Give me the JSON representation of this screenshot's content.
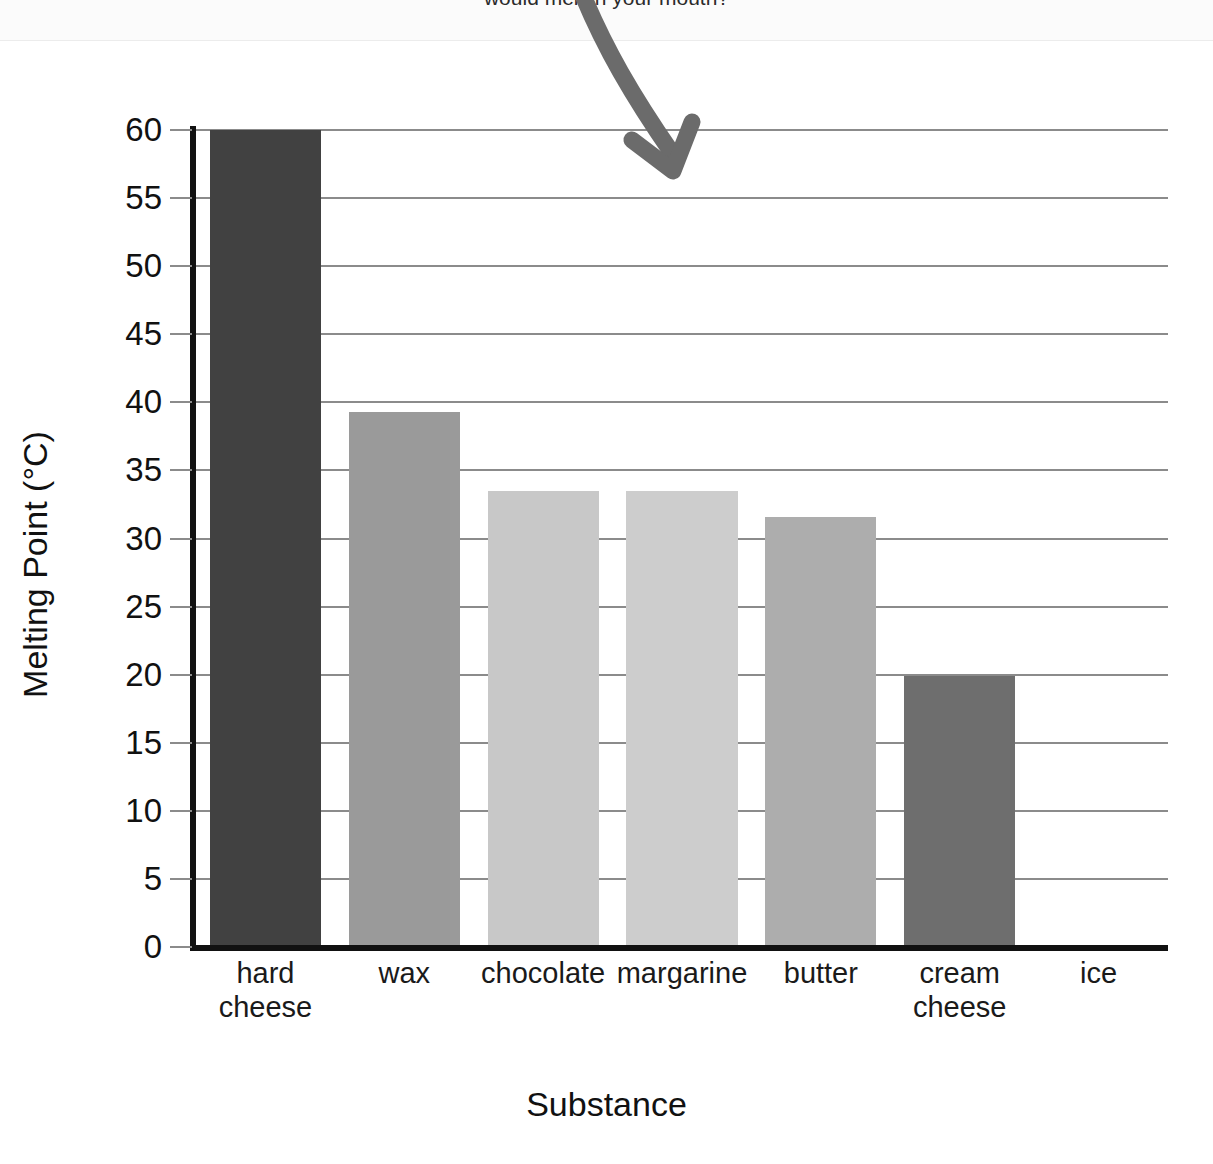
{
  "header": {
    "clipped_text": "would melt in your mouth?"
  },
  "axes": {
    "y_title": "Melting Point (°C)",
    "x_title": "Substance"
  },
  "annotation": {
    "arrow_name": "curved-down-arrow",
    "color": "#6b6b6b"
  },
  "colors": {
    "bar_hard_cheese": "#414141",
    "bar_wax": "#9a9a9a",
    "bar_chocolate": "#c8c8c8",
    "bar_margarine": "#cdcdcd",
    "bar_butter": "#adadad",
    "bar_cream_cheese": "#6e6e6e",
    "bar_ice": "#cdcdcd",
    "gridline": "#8b8b8b",
    "axis": "#111111",
    "text": "#111111"
  },
  "chart_data": {
    "type": "bar",
    "title": "",
    "xlabel": "Substance",
    "ylabel": "Melting Point (°C)",
    "ylim": [
      0,
      60
    ],
    "ytick_step": 5,
    "yticks": [
      0,
      5,
      10,
      15,
      20,
      25,
      30,
      35,
      40,
      45,
      50,
      55,
      60
    ],
    "ytick_labels": [
      "0",
      "5",
      "10",
      "15",
      "20",
      "25",
      "30",
      "35",
      "40",
      "45",
      "50",
      "55",
      "60"
    ],
    "grid": true,
    "grid_axis": "y",
    "legend": false,
    "categories": [
      "hard cheese",
      "wax",
      "chocolate",
      "margarine",
      "butter",
      "cream cheese",
      "ice"
    ],
    "category_lines": [
      [
        "hard",
        "cheese"
      ],
      [
        "wax"
      ],
      [
        "chocolate"
      ],
      [
        "margarine"
      ],
      [
        "butter"
      ],
      [
        "cream",
        "cheese"
      ],
      [
        "ice"
      ]
    ],
    "values": [
      60,
      39.3,
      33.5,
      33.5,
      31.6,
      19.9,
      0
    ],
    "bar_colors": [
      "#414141",
      "#9a9a9a",
      "#c8c8c8",
      "#cdcdcd",
      "#adadad",
      "#6e6e6e",
      "#cdcdcd"
    ]
  }
}
